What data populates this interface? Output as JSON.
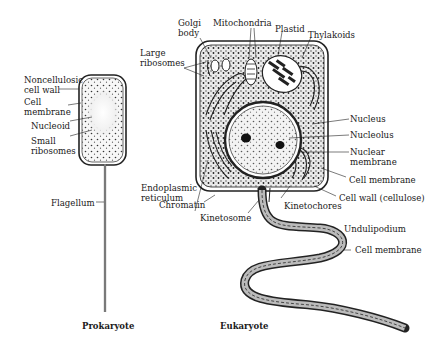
{
  "figure": {
    "prokaryote": {
      "caption": "Prokaryote",
      "labels": {
        "cell_wall": "Noncellulosic cell wall",
        "cell_membrane": "Cell membrane",
        "nucleoid": "Nucleoid",
        "small_ribosomes": "Small ribosomes",
        "flagellum": "Flagellum"
      }
    },
    "eukaryote": {
      "caption": "Eukaryote",
      "labels": {
        "golgi": "Golgi body",
        "mitochondria": "Mitochondria",
        "plastid": "Plastid",
        "thylakoids": "Thylakoids",
        "large_ribosomes": "Large ribosomes",
        "nucleus": "Nucleus",
        "nucleolus": "Nucleolus",
        "nuclear_membrane": "Nuclear membrane",
        "cell_membrane_1": "Cell membrane",
        "cell_wall": "Cell wall (cellulose)",
        "endoplasmic_reticulum": "Endoplasmic reticulum",
        "chromatin": "Chromatin",
        "kinetochores": "Kinetochores",
        "kinetosome": "Kinetosome",
        "undulipodium": "Undulipodium",
        "cell_membrane_2": "Cell membrane"
      }
    }
  }
}
